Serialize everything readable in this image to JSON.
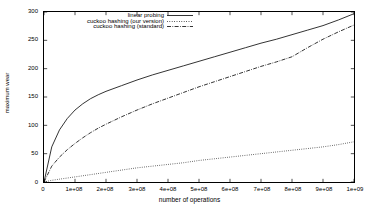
{
  "chart_data": {
    "type": "line",
    "title": "",
    "xlabel": "number of operations",
    "ylabel": "maximum wear",
    "xlim": [
      0,
      1000000000
    ],
    "ylim": [
      0,
      300
    ],
    "grid": false,
    "legend_position": "top-right-inside",
    "xticks": [
      {
        "value": 0,
        "label": "0"
      },
      {
        "value": 100000000,
        "label": "1e+08"
      },
      {
        "value": 200000000,
        "label": "2e+08"
      },
      {
        "value": 300000000,
        "label": "3e+08"
      },
      {
        "value": 400000000,
        "label": "4e+08"
      },
      {
        "value": 500000000,
        "label": "5e+08"
      },
      {
        "value": 600000000,
        "label": "6e+08"
      },
      {
        "value": 700000000,
        "label": "7e+08"
      },
      {
        "value": 800000000,
        "label": "8e+08"
      },
      {
        "value": 900000000,
        "label": "9e+08"
      },
      {
        "value": 1000000000,
        "label": "1e+09"
      }
    ],
    "yticks": [
      {
        "value": 0,
        "label": "0"
      },
      {
        "value": 50,
        "label": "50"
      },
      {
        "value": 100,
        "label": "100"
      },
      {
        "value": 150,
        "label": "150"
      },
      {
        "value": 200,
        "label": "200"
      },
      {
        "value": 250,
        "label": "250"
      },
      {
        "value": 300,
        "label": "300"
      }
    ],
    "x": [
      0,
      25000000,
      50000000,
      75000000,
      100000000,
      125000000,
      150000000,
      175000000,
      200000000,
      250000000,
      300000000,
      350000000,
      400000000,
      450000000,
      500000000,
      550000000,
      600000000,
      650000000,
      700000000,
      750000000,
      800000000,
      850000000,
      900000000,
      950000000,
      1000000000
    ],
    "series": [
      {
        "name": "linear probing",
        "style": "solid",
        "color": "#000000",
        "values": [
          0,
          62,
          92,
          112,
          127,
          138,
          147,
          154,
          160,
          170,
          180,
          189,
          197,
          205,
          213,
          221,
          229,
          237,
          245,
          252,
          260,
          268,
          276,
          286,
          297
        ]
      },
      {
        "name": "cuckoo hashing (our version)",
        "style": "dotted",
        "color": "#000000",
        "values": [
          0,
          3,
          5,
          7,
          9,
          11,
          13,
          15,
          17,
          21,
          25,
          28,
          31,
          34,
          38,
          41,
          44,
          47,
          50,
          53,
          56,
          59,
          62,
          66,
          71
        ]
      },
      {
        "name": "cuckoo hashing (standard)",
        "style": "dashdot",
        "color": "#000000",
        "values": [
          0,
          28,
          44,
          57,
          68,
          78,
          87,
          95,
          102,
          115,
          127,
          138,
          148,
          158,
          168,
          177,
          186,
          195,
          204,
          212,
          221,
          237,
          252,
          265,
          277
        ]
      }
    ]
  }
}
